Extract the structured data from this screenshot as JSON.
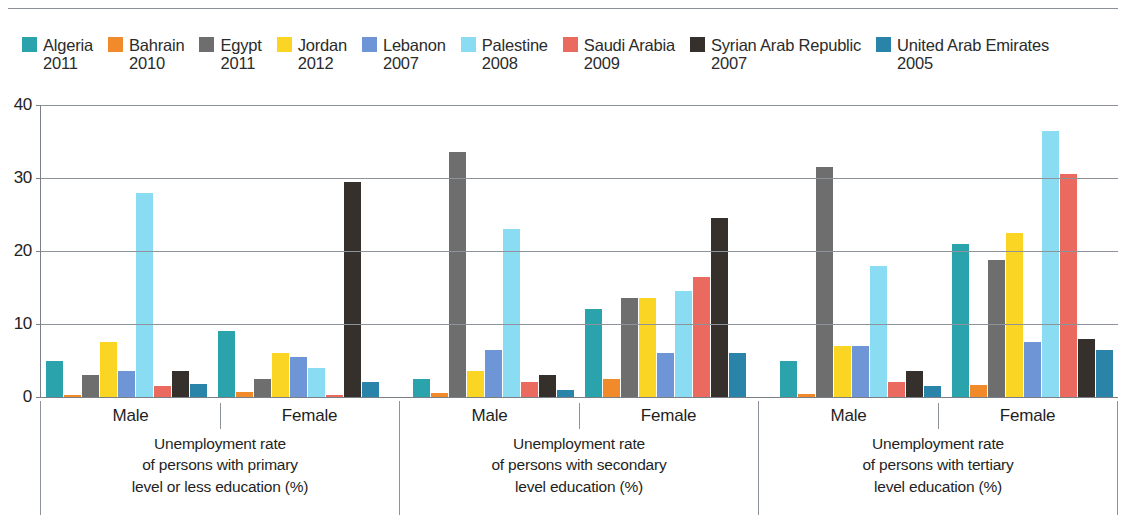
{
  "chart_data": {
    "type": "bar",
    "title": "",
    "subtitle": "",
    "xlabel": "",
    "ylabel": "",
    "ylim": [
      0,
      40
    ],
    "yticks": [
      0,
      10,
      20,
      30,
      40
    ],
    "ytick_labels": [
      "0",
      "10",
      "20",
      "30",
      "40"
    ],
    "grid": true,
    "legend_position": "top",
    "series": [
      {
        "name": "Algeria",
        "year": "2011",
        "color": "#2ba3ad",
        "values": [
          5.0,
          9.0,
          2.5,
          12.0,
          5.0,
          21.0
        ]
      },
      {
        "name": "Bahrain",
        "year": "2010",
        "color": "#f08a2b",
        "values": [
          0.3,
          0.7,
          0.5,
          2.5,
          0.4,
          1.7
        ]
      },
      {
        "name": "Egypt",
        "year": "2011",
        "color": "#6e6e6e",
        "values": [
          3.0,
          2.5,
          33.5,
          13.5,
          31.5,
          18.8
        ]
      },
      {
        "name": "Jordan",
        "year": "2012",
        "color": "#fbd523",
        "values": [
          7.5,
          6.0,
          3.5,
          13.5,
          7.0,
          22.5
        ]
      },
      {
        "name": "Lebanon",
        "year": "2007",
        "color": "#6e95d6",
        "values": [
          3.5,
          5.5,
          6.5,
          6.0,
          7.0,
          7.5
        ]
      },
      {
        "name": "Palestine",
        "year": "2008",
        "color": "#89dcf2",
        "values": [
          28.0,
          4.0,
          23.0,
          14.5,
          18.0,
          36.5
        ]
      },
      {
        "name": "Saudi Arabia",
        "year": "2009",
        "color": "#ea6a5f",
        "values": [
          1.5,
          0.3,
          2.0,
          16.5,
          2.0,
          30.5
        ]
      },
      {
        "name": "Syrian Arab Republic",
        "year": "2007",
        "color": "#36302c",
        "values": [
          3.5,
          29.5,
          3.0,
          24.5,
          3.5,
          8.0
        ]
      },
      {
        "name": "United Arab Emirates",
        "year": "2005",
        "color": "#2a83a8",
        "values": [
          1.8,
          2.0,
          1.0,
          6.0,
          1.5,
          6.5
        ]
      }
    ],
    "groups": [
      {
        "sex": "Male",
        "section": 0
      },
      {
        "sex": "Female",
        "section": 0
      },
      {
        "sex": "Male",
        "section": 1
      },
      {
        "sex": "Female",
        "section": 1
      },
      {
        "sex": "Male",
        "section": 2
      },
      {
        "sex": "Female",
        "section": 2
      }
    ],
    "sections": [
      {
        "caption_lines": [
          "Unemployment rate",
          "of persons with primary",
          "level or less education (%)"
        ],
        "male_label": "Male",
        "female_label": "Female"
      },
      {
        "caption_lines": [
          "Unemployment rate",
          "of persons with secondary",
          "level education (%)"
        ],
        "male_label": "Male",
        "female_label": "Female"
      },
      {
        "caption_lines": [
          "Unemployment rate",
          "of persons with tertiary",
          "level education (%)"
        ],
        "male_label": "Male",
        "female_label": "Female"
      }
    ]
  },
  "colors": {
    "background": "#ffffff",
    "gridline": "#8e9299",
    "axis": "#7a7e87",
    "text": "#1f1f1f"
  }
}
